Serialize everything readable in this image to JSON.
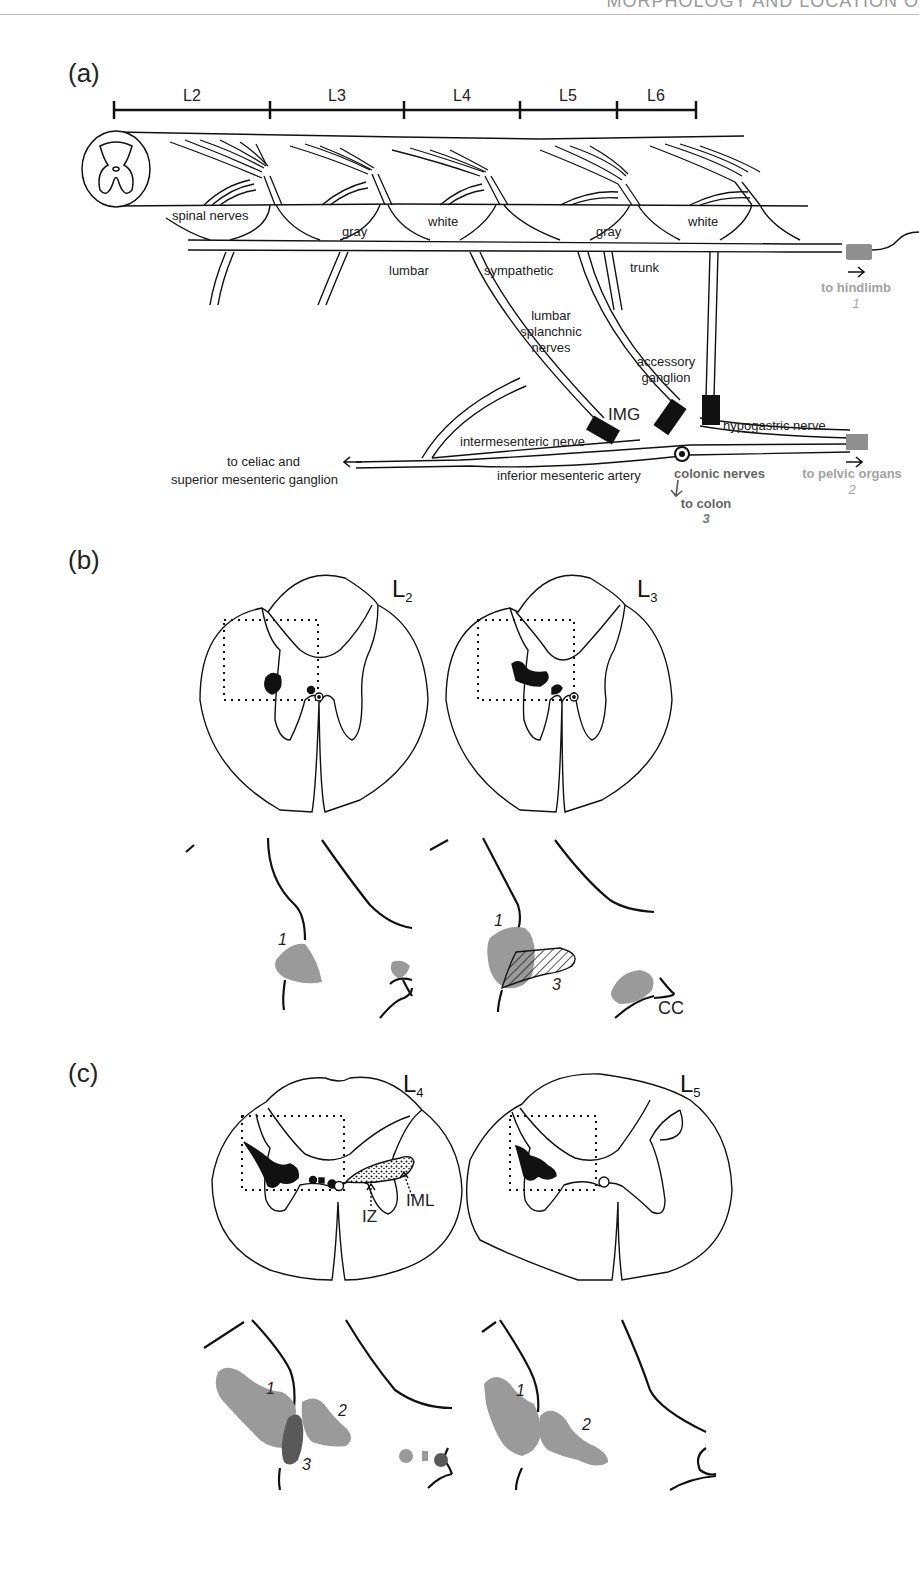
{
  "page": {
    "running_header": "MORPHOLOGY AND LOCATION O"
  },
  "panel_a": {
    "label": "(a)",
    "segments": [
      "L2",
      "L3",
      "L4",
      "L5",
      "L6"
    ],
    "labels": {
      "spinal_nerves": "spinal nerves",
      "gray1": "gray",
      "white1": "white",
      "gray2": "gray",
      "white2": "white",
      "lumbar": "lumbar",
      "sympathetic": "sympathetic",
      "trunk": "trunk",
      "lumbar_splanchnic_1": "lumbar",
      "lumbar_splanchnic_2": "splanchnic",
      "lumbar_splanchnic_3": "nerves",
      "accessory_1": "accessory",
      "accessory_2": "ganglion",
      "img": "IMG",
      "hypogastric": "hypogastric nerve",
      "intermesenteric": "intermesenteric nerve",
      "ima": "inferior mesenteric artery",
      "celiac_1": "to celiac and",
      "celiac_2": "superior mesenteric ganglion",
      "colonic": "colonic nerves",
      "to_colon": "to colon",
      "to_colon_num": "3",
      "to_hindlimb": "to hindlimb",
      "to_hindlimb_num": "1",
      "to_pelvic": "to pelvic organs",
      "to_pelvic_num": "2"
    },
    "colors": {
      "target_gray": "#8f8f8f",
      "label_gray": "#a3a3a3",
      "ink": "#111111"
    }
  },
  "panel_b": {
    "label": "(b)",
    "sections": [
      {
        "level": "L",
        "sub": "2"
      },
      {
        "level": "L",
        "sub": "3"
      }
    ],
    "detail_labels": {
      "l2_pool1": "1",
      "l3_pool1": "1",
      "l3_pool3": "3",
      "cc": "CC"
    }
  },
  "panel_c": {
    "label": "(c)",
    "sections": [
      {
        "level": "L",
        "sub": "4"
      },
      {
        "level": "L",
        "sub": "5"
      }
    ],
    "annotations": {
      "iz": "IZ",
      "iml": "IML"
    },
    "detail_labels": {
      "l4_pool1": "1",
      "l4_pool2": "2",
      "l4_pool3": "3",
      "l5_pool1": "1",
      "l5_pool2": "2"
    },
    "colors": {
      "pool_light": "#9a9a9a",
      "pool_dark": "#595959"
    }
  }
}
